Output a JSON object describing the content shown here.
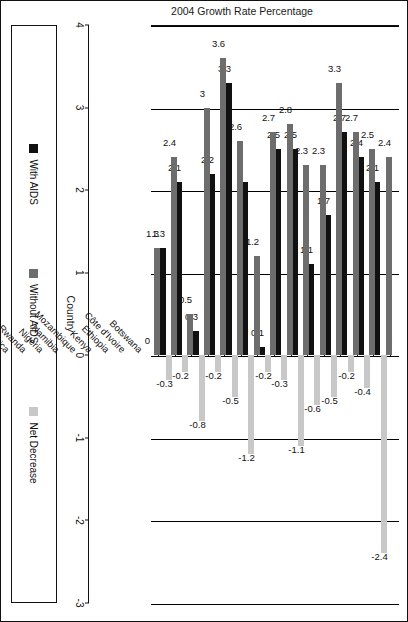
{
  "chart_data": {
    "type": "bar",
    "orientation": "vertical",
    "title": "",
    "xlabel": "Country",
    "ylabel": "2004 Growth Rate Percentage",
    "ylim": [
      -3,
      4
    ],
    "yticks": [
      -3,
      -2,
      -1,
      0,
      1,
      2,
      3,
      4
    ],
    "ytick_labels": [
      "-3",
      "-2",
      "-1",
      "0",
      "1",
      "2",
      "3",
      "4"
    ],
    "grid": true,
    "legend_position": "bottom",
    "categories": [
      "Botswana",
      "Côte d'Ivoire",
      "Ethiopia",
      "Kenya",
      "Mozambique",
      "Namibia",
      "Nigeria",
      "Rwanda",
      "South Africa",
      "Tanzania",
      "Uganda",
      "Zambia",
      "Guyana",
      "Haiti",
      "Vietnam"
    ],
    "series": [
      {
        "name": "With AIDS",
        "color": "#111111",
        "values": [
          0,
          2.1,
          2.4,
          2.7,
          1.7,
          1.1,
          2.5,
          2.5,
          0.1,
          2.1,
          3.3,
          2.2,
          0.3,
          2.1,
          1.3
        ],
        "labels": [
          "0",
          "2.1",
          "2.4",
          "2.7",
          "1.7",
          "1.1",
          "2.5",
          "2.5",
          "0.1",
          "",
          "3.3",
          "2.2",
          "0.3",
          "2.1",
          "1.3"
        ]
      },
      {
        "name": "Without AIDS",
        "color": "#6d6d6d",
        "values": [
          2.4,
          2.5,
          2.7,
          3.3,
          2.3,
          2.3,
          2.8,
          2.7,
          1.2,
          2.6,
          3.6,
          3,
          0.5,
          2.4,
          1.3
        ],
        "labels": [
          "2.4",
          "2.5",
          "2.7",
          "3.3",
          "2.3",
          "2.3",
          "2.8",
          "2.7",
          "1.2",
          "2.6",
          "3.6",
          "3",
          "0.5",
          "2.4",
          "1.3"
        ]
      },
      {
        "name": "Net Decrease",
        "color": "#c8c8c8",
        "values": [
          -2.4,
          -0.4,
          -0.2,
          -0.5,
          -0.6,
          -1.1,
          -0.3,
          -0.2,
          -1.2,
          -0.5,
          -0.2,
          -0.8,
          -0.2,
          -0.3,
          0
        ],
        "labels": [
          "-2.4",
          "-0.4",
          "-0.2",
          "-0.5",
          "-0.6",
          "-1.1",
          "-0.3",
          "-0.2",
          "-1.2",
          "-0.5",
          "-0.2",
          "-0.8",
          "-0.2",
          "-0.3",
          "0"
        ]
      }
    ]
  },
  "legend": {
    "items": [
      {
        "label": "With AIDS",
        "color": "#111111"
      },
      {
        "label": "Without AIDS",
        "color": "#6d6d6d"
      },
      {
        "label": "Net Decrease",
        "color": "#c8c8c8"
      }
    ]
  },
  "axes": {
    "value_axis_title": "2004 Growth Rate Percentage",
    "category_axis_title": "Country"
  }
}
